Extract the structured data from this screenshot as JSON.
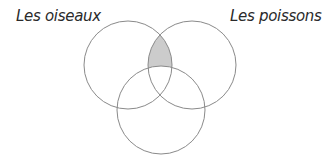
{
  "diagram": {
    "type": "venn",
    "sets": [
      {
        "id": "left",
        "label": "Les oiseaux",
        "cx": 128,
        "cy": 65,
        "r": 44
      },
      {
        "id": "right",
        "label": "Les poissons",
        "cx": 192,
        "cy": 65,
        "r": 44
      },
      {
        "id": "bottom",
        "label": "",
        "cx": 161,
        "cy": 110,
        "r": 44
      }
    ],
    "highlighted_region": "left ∩ right, outside bottom",
    "colors": {
      "stroke": "#8a8a8a",
      "shade": "#cccccc",
      "text": "#2a2a2a"
    }
  },
  "labels": {
    "left": "Les oiseaux",
    "right": "Les poissons"
  }
}
